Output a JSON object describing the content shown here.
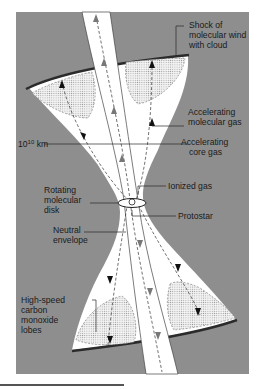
{
  "figure": {
    "type": "bipolar-outflow-diagram",
    "colors": {
      "background": "#8e8e8e",
      "lobe_fill": "#ffffff",
      "shock_rim": "#2b2b2b",
      "stipple": "#b9b9b9",
      "flow_line": "#333333",
      "jet_arrow": "#777777"
    },
    "labels": {
      "shock": [
        "Shock of",
        "molecular wind",
        "with cloud"
      ],
      "accel_molecular": [
        "Accelerating",
        "molecular gas"
      ],
      "scale": "10",
      "scale_exp": "10",
      "scale_unit": " km",
      "accel_core": [
        "Accelerating",
        "core gas"
      ],
      "ionized": "Ionized gas",
      "disk": [
        "Rotating",
        "molecular",
        "disk"
      ],
      "protostar": "Protostar",
      "envelope": [
        "Neutral",
        "envelope"
      ],
      "co_lobes": [
        "High-speed",
        "carbon",
        "monoxide",
        "lobes"
      ]
    }
  }
}
